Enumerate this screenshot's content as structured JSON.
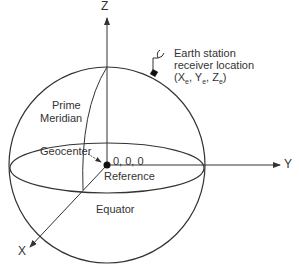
{
  "diagram": {
    "axes": {
      "x": "X",
      "y": "Y",
      "z": "Z"
    },
    "labels": {
      "prime_meridian_1": "Prime",
      "prime_meridian_2": "Meridian",
      "geocenter": "Geocenter",
      "origin": "0, 0, 0",
      "reference": "Reference",
      "equator": "Equator",
      "station_line1": "Earth station",
      "station_line2": "receiver location",
      "station_coords_open": "(X",
      "station_sub_x": "e",
      "station_sep1": ", Y",
      "station_sub_y": "e",
      "station_sep2": ", Z",
      "station_sub_z": "e",
      "station_close": ")"
    },
    "colors": {
      "line": "#333333",
      "background": "#ffffff"
    }
  }
}
